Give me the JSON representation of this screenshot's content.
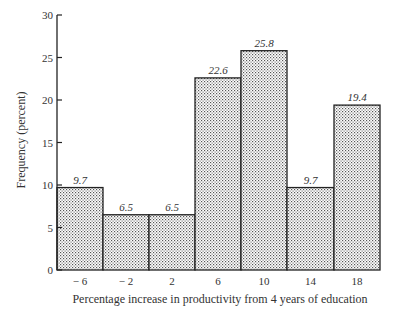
{
  "chart_data": {
    "type": "bar",
    "title": "",
    "xlabel": "Percentage increase in productivity from 4 years of education",
    "ylabel": "Frequency (percent)",
    "categories": [
      "− 6",
      "− 2",
      "2",
      "6",
      "10",
      "14",
      "18"
    ],
    "values": [
      9.7,
      6.5,
      6.5,
      22.6,
      25.8,
      9.7,
      19.4
    ],
    "value_labels": [
      "9.7",
      "6.5",
      "6.5",
      "22.6",
      "25.8",
      "9.7",
      "19.4"
    ],
    "ylim": [
      0,
      30
    ],
    "yticks": [
      0,
      5,
      10,
      15,
      20,
      25,
      30
    ],
    "grid": false,
    "legend": null,
    "style": "histogram with stippled (dotted) fill, adjacent bars"
  }
}
